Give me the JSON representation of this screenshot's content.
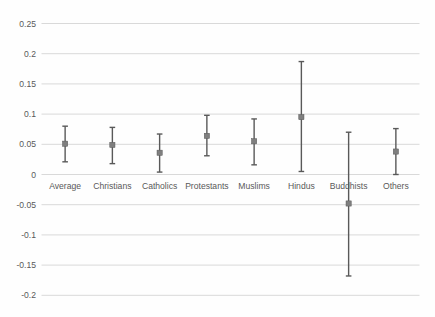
{
  "chart_data": {
    "type": "scatter",
    "subtype": "point-estimates-with-error-bars",
    "title": "",
    "xlabel": "",
    "ylabel": "",
    "categories": [
      "Average",
      "Christians",
      "Catholics",
      "Protestants",
      "Muslims",
      "Hindus",
      "Buddhists",
      "Others"
    ],
    "series": [
      {
        "name": "estimate",
        "values": [
          0.051,
          0.049,
          0.036,
          0.064,
          0.055,
          0.095,
          -0.048,
          0.038
        ],
        "ci_low": [
          0.021,
          0.018,
          0.004,
          0.031,
          0.016,
          0.005,
          -0.168,
          0.0
        ],
        "ci_high": [
          0.08,
          0.078,
          0.067,
          0.098,
          0.092,
          0.187,
          0.07,
          0.076
        ]
      }
    ],
    "ylim": [
      -0.2,
      0.25
    ],
    "yticks": [
      0.25,
      0.2,
      0.15,
      0.1,
      0.05,
      0,
      -0.05,
      -0.1,
      -0.15,
      -0.2
    ],
    "ytick_labels": [
      "0.25",
      "0.2",
      "0.15",
      "0.1",
      "0.05",
      "0",
      "-0.05",
      "-0.1",
      "-0.15",
      "-0.2"
    ],
    "grid": "horizontal",
    "legend_position": "none",
    "colors": {
      "gridline": "#d9d9d9",
      "error_bar": "#595959",
      "marker": "#7f7f7f",
      "tick_text": "#595959",
      "background": "#fefefe"
    }
  }
}
